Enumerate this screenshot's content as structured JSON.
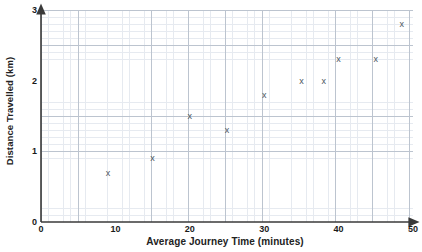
{
  "chart_data": {
    "type": "scatter",
    "title": "",
    "xlabel": "Average Journey Time (minutes)",
    "ylabel": "Distance Travelled (km)",
    "xlim": [
      0,
      50
    ],
    "ylim": [
      0,
      3
    ],
    "xticks": [
      "0",
      "10",
      "20",
      "30",
      "40",
      "50"
    ],
    "xtick_values": [
      0,
      10,
      20,
      30,
      40,
      50
    ],
    "yticks": [
      "0",
      "1",
      "2",
      "3"
    ],
    "ytick_values": [
      0,
      1,
      2,
      3
    ],
    "x_major_step": 5,
    "x_minor_step": 1,
    "y_major_step": 0.5,
    "y_minor_step": 0.1,
    "grid": true,
    "legend": "none",
    "marker": "x",
    "marker_color": "#4b5560",
    "grid_major_color": "#bcc4cf",
    "grid_minor_color": "#e6eaf0",
    "axis_color": "#3a3a3a",
    "points": [
      {
        "x": 9,
        "y": 0.7
      },
      {
        "x": 15,
        "y": 0.9
      },
      {
        "x": 20,
        "y": 1.5
      },
      {
        "x": 25,
        "y": 1.3
      },
      {
        "x": 30,
        "y": 1.8
      },
      {
        "x": 35,
        "y": 2.0
      },
      {
        "x": 38,
        "y": 2.0
      },
      {
        "x": 40,
        "y": 2.3
      },
      {
        "x": 45,
        "y": 2.3
      },
      {
        "x": 48.5,
        "y": 2.8
      }
    ]
  }
}
